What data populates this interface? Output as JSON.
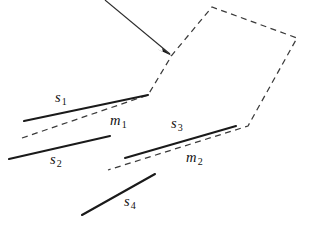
{
  "figure": {
    "background_color": "#ffffff",
    "width": 309,
    "height": 225,
    "solid_stroke_color": "#1a1a1a",
    "dashed_stroke_color": "#3a3a3a",
    "arrow_color": "#2b2b2b"
  },
  "labels": {
    "s1": {
      "base": "s",
      "sub": "1",
      "x": 55,
      "y": 90
    },
    "s2": {
      "base": "s",
      "sub": "2",
      "x": 50,
      "y": 152
    },
    "s3": {
      "base": "s",
      "sub": "3",
      "x": 171,
      "y": 116
    },
    "s4": {
      "base": "s",
      "sub": "4",
      "x": 124,
      "y": 194
    },
    "m1": {
      "base": "m",
      "sub": "1",
      "x": 110,
      "y": 113
    },
    "m2": {
      "base": "m",
      "sub": "2",
      "x": 186,
      "y": 150
    }
  },
  "geometry": {
    "dashed_polyline": {
      "name": "approximating-dashed-boundary",
      "points": "22,138 148,95 172,55 212,7 297,38 248,126 108,170"
    },
    "solid_segments": [
      {
        "name": "segment-s1",
        "x1": 24,
        "y1": 121,
        "x2": 148,
        "y2": 95
      },
      {
        "name": "segment-s2",
        "x1": 9,
        "y1": 159,
        "x2": 110,
        "y2": 136
      },
      {
        "name": "segment-s3",
        "x1": 125,
        "y1": 158,
        "x2": 236,
        "y2": 126
      },
      {
        "name": "segment-s4",
        "x1": 82,
        "y1": 215,
        "x2": 155,
        "y2": 174
      }
    ],
    "arrow": {
      "name": "annotation-arrow",
      "x1": 105,
      "y1": 0,
      "x2": 170,
      "y2": 54,
      "head_points": "172,56 162,48 163,52 157,49"
    }
  }
}
